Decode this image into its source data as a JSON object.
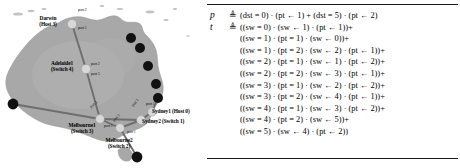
{
  "figure": {
    "colors": {
      "map_fill": "#a8a8a8",
      "map_outline": "#8f8f8f",
      "switch_node": "#d8d8d8",
      "host_node": "#111111",
      "link": "#6e6e6e",
      "text": "#000000",
      "rule": "#1a1a1a",
      "background": "#ffffff"
    }
  },
  "map": {
    "name": "australia-topology-map",
    "nodes": [
      {
        "id": "darwin",
        "label_line1": "Darwin",
        "label_line2": "(Host 3)",
        "type": "host-switch",
        "x": 72,
        "y": 24,
        "r": 4.6
      },
      {
        "id": "adelaide1",
        "label_line1": "Adelaide1",
        "label_line2": "(Switch 4)",
        "type": "switch",
        "x": 86,
        "y": 69,
        "r": 4.6
      },
      {
        "id": "melbourne1",
        "label_line1": "Melbourne1",
        "label_line2": "(Switch 3)",
        "type": "switch",
        "x": 100,
        "y": 119,
        "r": 4.4
      },
      {
        "id": "melbourne2",
        "label_line1": "Melbourne2",
        "label_line2": "(Switch 2)",
        "type": "switch",
        "x": 120,
        "y": 128,
        "r": 4.4
      },
      {
        "id": "sydney2",
        "label_line1": "Sydney2",
        "label_line2": "(Switch 1)",
        "type": "switch",
        "x": 141,
        "y": 120,
        "r": 4.4
      },
      {
        "id": "sydney1",
        "label_line1": "Sydney1",
        "label_line2": "(Host 0)",
        "type": "switch",
        "x": 152,
        "y": 112,
        "r": 4.2
      }
    ],
    "host_dots": [
      {
        "id": "coast-dot-1",
        "x": 131,
        "y": 38,
        "r": 5.0
      },
      {
        "id": "coast-dot-2",
        "x": 140,
        "y": 48,
        "r": 5.0
      },
      {
        "id": "coast-dot-3",
        "x": 148,
        "y": 66,
        "r": 5.0
      },
      {
        "id": "coast-dot-4",
        "x": 156,
        "y": 84,
        "r": 5.0
      },
      {
        "id": "coast-dot-5",
        "x": 158,
        "y": 98,
        "r": 5.0
      },
      {
        "id": "west-dot",
        "x": 13,
        "y": 104,
        "r": 5.4
      },
      {
        "id": "south-dot",
        "x": 137,
        "y": 157,
        "r": 5.4
      }
    ],
    "links": [
      {
        "from": "darwin",
        "to": "adelaide1"
      },
      {
        "from": "adelaide1",
        "to": "melbourne1"
      },
      {
        "from": "melbourne1",
        "to": "melbourne2"
      },
      {
        "from": "melbourne2",
        "to": "sydney2"
      },
      {
        "from": "sydney2",
        "to": "sydney1"
      },
      {
        "from": "melbourne1",
        "to": "sydney2"
      },
      {
        "from": "melbourne1",
        "to": "west-dot"
      },
      {
        "from": "melbourne2",
        "to": "south-dot"
      },
      {
        "from": "sydney1",
        "to": "coast-dot-5"
      }
    ],
    "port_labels": [
      {
        "id": "darwin-port-2",
        "text": "port 2",
        "x": 78,
        "y": 11
      },
      {
        "id": "darwin-port-1",
        "text": "port 1",
        "x": 78,
        "y": 28
      },
      {
        "id": "adelaide-port-2",
        "text": "port 2",
        "x": 91,
        "y": 63
      },
      {
        "id": "adelaide-port-3",
        "text": "port 3",
        "x": 91,
        "y": 74
      },
      {
        "id": "melbourne1-port-2",
        "text": "port 2",
        "x": 93,
        "y": 107
      },
      {
        "id": "melbourne1-port-1",
        "text": "port 1",
        "x": 106,
        "y": 124
      },
      {
        "id": "melbourne2-port-2",
        "text": "port 2",
        "x": 113,
        "y": 121
      },
      {
        "id": "melbourne2-port-1",
        "text": "port 1",
        "x": 128,
        "y": 131
      },
      {
        "id": "sydney2-port-2",
        "text": "port 2",
        "x": 133,
        "y": 106
      },
      {
        "id": "sydney2-port-1",
        "text": "port 1",
        "x": 145,
        "y": 103
      }
    ]
  },
  "equations": {
    "name": "netkat-terms",
    "policy": {
      "symbol": "p",
      "defined_as": "≜",
      "lines": [
        "(dst = 0) · (pt ← 1) + (dst = 5) · (pt ← 2)"
      ]
    },
    "topology": {
      "symbol": "t",
      "defined_as": "≜",
      "lines": [
        "((sw = 0) · (sw ← 1) · (pt ← 1))+",
        "((sw = 1) · (pt = 1) · (sw ← 0))+",
        "((sw = 1) · (pt = 2) · (sw ← 2) · (pt ← 1))+",
        "((sw = 2) · (pt = 1) · (sw ← 1) · (pt ← 2))+",
        "((sw = 2) · (pt = 2) · (sw ← 3) · (pt ← 1))+",
        "((sw = 3) · (pt = 1) · (sw ← 2) · (pt ← 2))+",
        "((sw = 3) · (pt = 2) · (sw ← 4) · (pt ← 1))+",
        "((sw = 4) · (pt = 1) · (sw ← 3) · (pt ← 2))+",
        "((sw = 4) · (pt = 2) · (sw ← 5))+",
        "((sw = 5) · (sw ← 4) · (pt ← 2))"
      ]
    }
  }
}
